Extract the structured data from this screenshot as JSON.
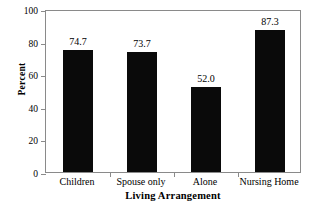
{
  "chart_data": {
    "type": "bar",
    "title": "",
    "xlabel": "Living Arrangement",
    "ylabel": "Percent",
    "categories": [
      "Children",
      "Spouse only",
      "Alone",
      "Nursing Home"
    ],
    "values": [
      74.7,
      73.7,
      52.0,
      87.3
    ],
    "value_labels": [
      "74.7",
      "73.7",
      "52.0",
      "87.3"
    ],
    "ylim": [
      0,
      100
    ],
    "ytick_labels": [
      "0",
      "20",
      "40",
      "60",
      "80",
      "100"
    ],
    "ytick_values": [
      0,
      20,
      40,
      60,
      80,
      100
    ],
    "grid": false,
    "legend": false,
    "legend_position": "none",
    "bar_color": "#0a0a0a",
    "frame_color": "#8a8a8a",
    "background_color": "#ffffff"
  }
}
